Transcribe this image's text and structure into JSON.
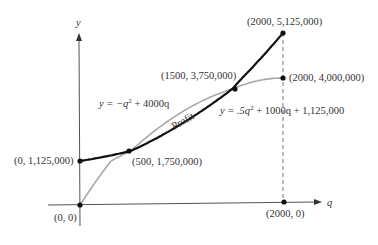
{
  "chart_data": {
    "type": "line",
    "title": "",
    "xlabel": "q",
    "ylabel": "y",
    "xlim": [
      0,
      2000
    ],
    "ylim": [
      0,
      5125000
    ],
    "grid": false,
    "series": [
      {
        "name": "Revenue",
        "equation": "y = −q² + 4000q",
        "color": "#a8a8a8",
        "x": [
          0,
          500,
          1000,
          1500,
          2000
        ],
        "values": [
          0,
          1750000,
          3000000,
          3750000,
          4000000
        ]
      },
      {
        "name": "Cost",
        "equation": "y = .5q² + 1000q + 1,125,000",
        "color": "#111111",
        "x": [
          0,
          500,
          1000,
          1500,
          2000
        ],
        "values": [
          1125000,
          1750000,
          2625000,
          3750000,
          5125000
        ]
      }
    ],
    "points": [
      {
        "label": "(0, 0)",
        "x": 0,
        "y": 0
      },
      {
        "label": "(0, 1,125,000)",
        "x": 0,
        "y": 1125000
      },
      {
        "label": "(500, 1,750,000)",
        "x": 500,
        "y": 1750000
      },
      {
        "label": "(1500, 3,750,000)",
        "x": 1500,
        "y": 3750000
      },
      {
        "label": "(2000, 4,000,000)",
        "x": 2000,
        "y": 4000000
      },
      {
        "label": "(2000, 5,125,000)",
        "x": 2000,
        "y": 5125000
      },
      {
        "label": "(2000, 0)",
        "x": 2000,
        "y": 0
      }
    ],
    "annotations": [
      {
        "text": "Profit",
        "region": "between curves, 500 < q < 1500"
      }
    ]
  },
  "labels": {
    "y_axis": "y",
    "x_axis": "q",
    "eq_revenue_prefix": "y = −q",
    "eq_revenue_sup": "2",
    "eq_revenue_suffix": " + 4000q",
    "eq_cost_prefix": "y = .5q",
    "eq_cost_sup": "2",
    "eq_cost_suffix": " + 1000q + 1,125,000",
    "profit": "Profit",
    "pt_origin": "(0, 0)",
    "pt_fixed_cost": "(0, 1,125,000)",
    "pt_break_even_1": "(500, 1,750,000)",
    "pt_break_even_2": "(1500, 3,750,000)",
    "pt_revenue_end": "(2000, 4,000,000)",
    "pt_cost_end": "(2000, 5,125,000)",
    "pt_x_end": "(2000, 0)"
  }
}
